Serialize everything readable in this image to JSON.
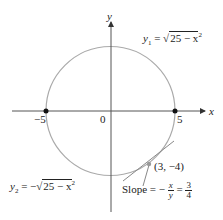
{
  "diagram": {
    "axis_x_label": "x",
    "axis_y_label": "y",
    "origin_label": "0",
    "tick_neg5": "−5",
    "tick_pos5": "5",
    "upper_eq": {
      "lhs": "y",
      "sub": "1",
      "eq": " = ",
      "radical": "25 − x",
      "exp": "2"
    },
    "lower_eq": {
      "lhs": "y",
      "sub": "2",
      "eq": " = −",
      "radical": "25 − x",
      "exp": "2"
    },
    "point_label": "(3, −4)",
    "slope": {
      "word": "Slope",
      "eq1": " = −",
      "num1": "x",
      "den1": "y",
      "eq2": " = ",
      "num2": "3",
      "den2": "4"
    },
    "colors": {
      "circle": "#aaaaaa",
      "axis": "#555555",
      "tangent": "#888888",
      "dot": "#111111"
    }
  }
}
